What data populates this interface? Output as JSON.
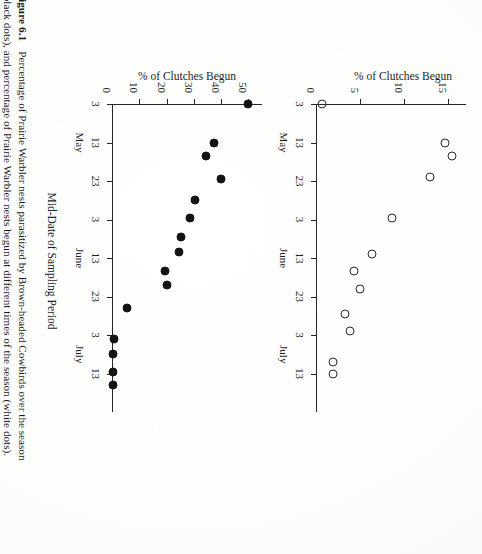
{
  "figure": {
    "number_label": "Figure 6.1",
    "caption_lines": [
      "Percentage of Prairie Warbler nests parasitized by Brown-headed Cowbirds over the season",
      "(black dots), and percentage of Prairie Warbler nests begun at different times of the season (white dots)."
    ],
    "x_axis_title": "Mid-Date of Sampling Period"
  },
  "chart_data": [
    {
      "id": "clutches-begun",
      "type": "scatter",
      "title": "",
      "marker": "open-circle",
      "marker_color": "#2a2a2a",
      "xlabel": "Mid-Date of Sampling Period",
      "ylabel": "% of Clutches Begun",
      "ylim": [
        0,
        17
      ],
      "yticks": [
        0,
        5,
        10,
        15
      ],
      "ytick_labels": [
        "0",
        "5",
        "10",
        "15"
      ],
      "xlim": [
        0,
        8
      ],
      "xtick_labels": [
        "3",
        "13",
        "23",
        "3",
        "13",
        "23",
        "3",
        "13"
      ],
      "month_groups": [
        {
          "label": "May",
          "center_index": 1
        },
        {
          "label": "June",
          "center_index": 4
        },
        {
          "label": "July",
          "center_index": 6.5
        }
      ],
      "grid": false,
      "legend": "white dots",
      "points": [
        {
          "x": 0,
          "y": 0.7
        },
        {
          "x": 1,
          "y": 14.6
        },
        {
          "x": 1.35,
          "y": 15.4
        },
        {
          "x": 1.9,
          "y": 12.9
        },
        {
          "x": 2.95,
          "y": 8.6
        },
        {
          "x": 3.9,
          "y": 6.4
        },
        {
          "x": 4.35,
          "y": 4.3
        },
        {
          "x": 4.8,
          "y": 5.0
        },
        {
          "x": 5.45,
          "y": 3.3
        },
        {
          "x": 5.9,
          "y": 3.9
        },
        {
          "x": 6.7,
          "y": 1.9
        },
        {
          "x": 7.0,
          "y": 1.9
        }
      ]
    },
    {
      "id": "nests-parasitized",
      "type": "scatter",
      "title": "",
      "marker": "filled-circle",
      "marker_color": "#141414",
      "xlabel": "Mid-Date of Sampling Period",
      "ylabel": "% of Clutches Begun",
      "ylim": [
        0,
        55
      ],
      "yticks": [
        0,
        10,
        20,
        30,
        40,
        50
      ],
      "ytick_labels": [
        "0",
        "10",
        "20",
        "30",
        "40",
        "50"
      ],
      "xlim": [
        0,
        8
      ],
      "xtick_labels": [
        "3",
        "13",
        "23",
        "3",
        "13",
        "23",
        "3",
        "13"
      ],
      "month_groups": [
        {
          "label": "May",
          "center_index": 1
        },
        {
          "label": "June",
          "center_index": 4
        },
        {
          "label": "July",
          "center_index": 6.5
        }
      ],
      "grid": false,
      "legend": "black dots",
      "points": [
        {
          "x": 0,
          "y": 50.0
        },
        {
          "x": 1.0,
          "y": 37.5
        },
        {
          "x": 1.35,
          "y": 34.6
        },
        {
          "x": 1.95,
          "y": 39.8
        },
        {
          "x": 2.5,
          "y": 30.3
        },
        {
          "x": 2.95,
          "y": 28.5
        },
        {
          "x": 3.45,
          "y": 25.3
        },
        {
          "x": 3.85,
          "y": 24.5
        },
        {
          "x": 4.35,
          "y": 19.4
        },
        {
          "x": 4.7,
          "y": 20.3
        },
        {
          "x": 5.3,
          "y": 5.6
        },
        {
          "x": 6.1,
          "y": 0.6
        },
        {
          "x": 6.5,
          "y": 0.4
        },
        {
          "x": 6.95,
          "y": 0.5
        },
        {
          "x": 7.3,
          "y": 0.4
        }
      ]
    }
  ]
}
